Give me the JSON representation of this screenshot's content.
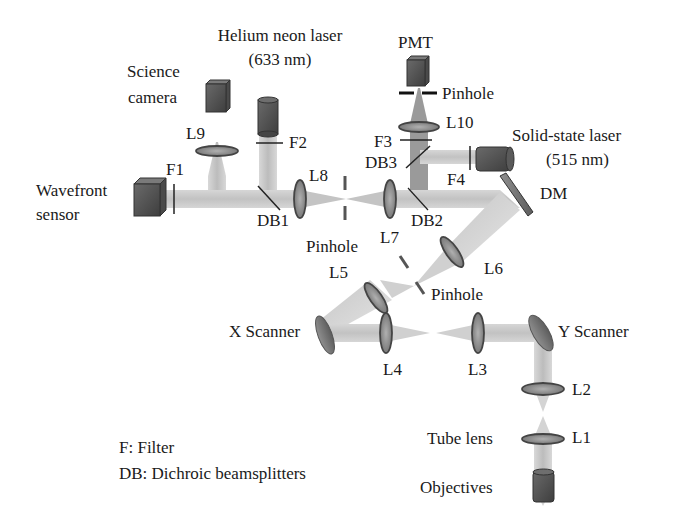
{
  "diagram": {
    "type": "optical-setup-schematic",
    "components": {
      "helium_neon_laser": {
        "line1": "Helium neon laser",
        "line2": "(633 nm)"
      },
      "science_camera": {
        "line1": "Science",
        "line2": "camera"
      },
      "pmt": "PMT",
      "pinhole_pmt": "Pinhole",
      "solid_state_laser": {
        "line1": "Solid-state laser",
        "line2": "(515 nm)"
      },
      "wavefront_sensor": {
        "line1": "Wavefront",
        "line2": "sensor"
      },
      "dm": "DM",
      "pinhole_mid": "Pinhole",
      "pinhole_lower": "Pinhole",
      "x_scanner": "X Scanner",
      "y_scanner": "Y Scanner",
      "tube_lens": "Tube lens",
      "objectives": "Objectives"
    },
    "lenses": {
      "L1": "L1",
      "L2": "L2",
      "L3": "L3",
      "L4": "L4",
      "L5": "L5",
      "L6": "L6",
      "L7": "L7",
      "L8": "L8",
      "L9": "L9",
      "L10": "L10"
    },
    "filters": {
      "F1": "F1",
      "F2": "F2",
      "F3": "F3",
      "F4": "F4"
    },
    "beamsplitters": {
      "DB1": "DB1",
      "DB2": "DB2",
      "DB3": "DB3"
    },
    "legend": {
      "filter": "F: Filter",
      "dichroic": "DB: Dichroic beamsplitters"
    },
    "colors": {
      "beam": "#c8c8c8",
      "component": "#5a5a5a",
      "component_dark": "#3a3a3a",
      "text": "#1a1a1a"
    }
  }
}
